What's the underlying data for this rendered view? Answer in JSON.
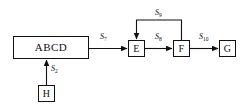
{
  "diagram": {
    "type": "block-flow-diagram",
    "background_color": "#ffffff",
    "line_color": "#111111",
    "nodes": [
      {
        "id": "abcd",
        "label": "ABCD"
      },
      {
        "id": "e",
        "label": "E"
      },
      {
        "id": "f",
        "label": "F"
      },
      {
        "id": "g",
        "label": "G"
      },
      {
        "id": "h",
        "label": "H"
      }
    ],
    "edges": [
      {
        "id": "s7",
        "from": "abcd",
        "to": "e",
        "symbol": "S",
        "subscript": "7",
        "direction": "right"
      },
      {
        "id": "s8",
        "from": "e",
        "to": "f",
        "symbol": "S",
        "subscript": "8",
        "direction": "right"
      },
      {
        "id": "s9",
        "from": "f",
        "to": "e",
        "symbol": "S",
        "subscript": "9",
        "direction": "feedback-top"
      },
      {
        "id": "s10",
        "from": "f",
        "to": "g",
        "symbol": "S",
        "subscript": "10",
        "direction": "right"
      },
      {
        "id": "s2",
        "from": "h",
        "to": "abcd",
        "symbol": "S",
        "subscript": "2",
        "direction": "up"
      }
    ]
  }
}
